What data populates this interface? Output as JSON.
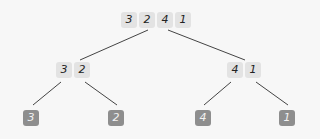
{
  "diagram": {
    "type": "merge-sort-split-tree",
    "root": {
      "values": [
        "3",
        "2",
        "4",
        "1"
      ]
    },
    "level1": [
      {
        "values": [
          "3",
          "2"
        ]
      },
      {
        "values": [
          "4",
          "1"
        ]
      }
    ],
    "leaves": [
      {
        "value": "3"
      },
      {
        "value": "2"
      },
      {
        "value": "4"
      },
      {
        "value": "1"
      }
    ],
    "colors": {
      "background": "#f7f7f7",
      "cell": "#e3e3e3",
      "leaf": "#8e8e8e",
      "edge": "#444444"
    }
  }
}
